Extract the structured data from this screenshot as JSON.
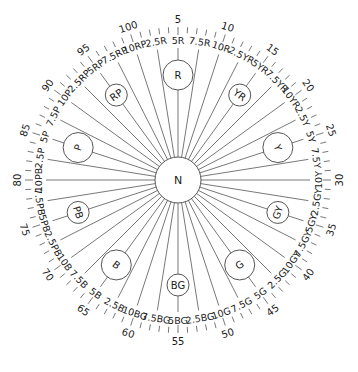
{
  "diagram": {
    "center": {
      "label": "N"
    },
    "colors": {
      "line": "#555555",
      "text": "#1a1a1a",
      "background": "#ffffff"
    },
    "geometry": {
      "cx": 178,
      "cy": 180,
      "center_radius": 23,
      "line_outer_radius": 132,
      "hue_label_radius": 140,
      "tick_inner_radius": 147,
      "tick_outer_radius": 153,
      "number_radius": 161,
      "hue_circle_radius_orbit": 105,
      "major_circle_size": 15,
      "minor_circle_size": 11,
      "start_index": 5,
      "degrees_per_step": 3.6
    },
    "numbers": [
      5,
      10,
      15,
      20,
      25,
      30,
      35,
      40,
      45,
      50,
      55,
      60,
      65,
      70,
      75,
      80,
      85,
      90,
      95,
      100
    ],
    "hue_labels": [
      {
        "idx": 2.5,
        "label": "2.5R"
      },
      {
        "idx": 5,
        "label": "5R"
      },
      {
        "idx": 7.5,
        "label": "7.5R"
      },
      {
        "idx": 10,
        "label": "10R"
      },
      {
        "idx": 12.5,
        "label": "2.5YR"
      },
      {
        "idx": 15,
        "label": "5YR"
      },
      {
        "idx": 17.5,
        "label": "7.5YR"
      },
      {
        "idx": 20,
        "label": "10YR"
      },
      {
        "idx": 22.5,
        "label": "2.5Y"
      },
      {
        "idx": 25,
        "label": "5Y"
      },
      {
        "idx": 27.5,
        "label": "7.5Y"
      },
      {
        "idx": 30,
        "label": "10Y"
      },
      {
        "idx": 32.5,
        "label": "2.5GY"
      },
      {
        "idx": 35,
        "label": "5GY"
      },
      {
        "idx": 37.5,
        "label": "7.5GY"
      },
      {
        "idx": 40,
        "label": "10GY"
      },
      {
        "idx": 42.5,
        "label": "2.5G"
      },
      {
        "idx": 45,
        "label": "5G"
      },
      {
        "idx": 47.5,
        "label": "7.5G"
      },
      {
        "idx": 50,
        "label": "10G"
      },
      {
        "idx": 52.5,
        "label": "2.5BG"
      },
      {
        "idx": 55,
        "label": "5BG"
      },
      {
        "idx": 57.5,
        "label": "7.5BG"
      },
      {
        "idx": 60,
        "label": "10BG"
      },
      {
        "idx": 62.5,
        "label": "2.5B"
      },
      {
        "idx": 65,
        "label": "5B"
      },
      {
        "idx": 67.5,
        "label": "7.5B"
      },
      {
        "idx": 70,
        "label": "10B"
      },
      {
        "idx": 72.5,
        "label": "2.5PB"
      },
      {
        "idx": 75,
        "label": "5PB"
      },
      {
        "idx": 77.5,
        "label": "7.5PB"
      },
      {
        "idx": 80,
        "label": "10PB"
      },
      {
        "idx": 82.5,
        "label": "2.5P"
      },
      {
        "idx": 85,
        "label": "5P"
      },
      {
        "idx": 87.5,
        "label": "7.5P"
      },
      {
        "idx": 90,
        "label": "10P"
      },
      {
        "idx": 92.5,
        "label": "2.5RP"
      },
      {
        "idx": 95,
        "label": "5RP"
      },
      {
        "idx": 97.5,
        "label": "7.5RP"
      },
      {
        "idx": 100,
        "label": "10RP"
      }
    ],
    "hue_circles": [
      {
        "idx": 5,
        "label": "R",
        "major": true
      },
      {
        "idx": 15,
        "label": "YR",
        "major": false
      },
      {
        "idx": 25,
        "label": "Y",
        "major": true
      },
      {
        "idx": 35,
        "label": "GY",
        "major": false
      },
      {
        "idx": 45,
        "label": "G",
        "major": true
      },
      {
        "idx": 55,
        "label": "BG",
        "major": false
      },
      {
        "idx": 65,
        "label": "B",
        "major": true
      },
      {
        "idx": 75,
        "label": "PB",
        "major": false
      },
      {
        "idx": 85,
        "label": "P",
        "major": true
      },
      {
        "idx": 95,
        "label": "RP",
        "major": false
      }
    ]
  }
}
